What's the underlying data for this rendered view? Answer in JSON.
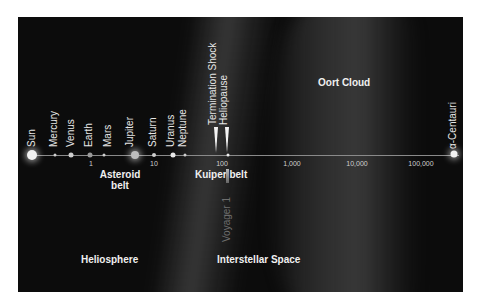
{
  "diagram": {
    "objects": [
      {
        "label": "Sun",
        "x": 14,
        "size": 9
      },
      {
        "label": "Mercury",
        "x": 37,
        "size": 3
      },
      {
        "label": "Venus",
        "x": 53,
        "size": 5
      },
      {
        "label": "Earth",
        "x": 72,
        "size": 5
      },
      {
        "label": "Mars",
        "x": 86,
        "size": 3
      },
      {
        "label": "Jupiter",
        "x": 117,
        "size": 8
      },
      {
        "label": "Saturn",
        "x": 136,
        "size": 4
      },
      {
        "label": "Uranus",
        "x": 155,
        "size": 5
      },
      {
        "label": "Neptune",
        "x": 167,
        "size": 3
      }
    ],
    "ticks": [
      {
        "label": "1",
        "x": 73
      },
      {
        "label": "10",
        "x": 136
      },
      {
        "label": "100",
        "x": 204
      },
      {
        "label": "1,000",
        "x": 274
      },
      {
        "label": "10,000",
        "x": 339
      },
      {
        "label": "100,000",
        "x": 403
      }
    ],
    "boundaries": {
      "termination_shock": "Termination Shock",
      "heliopause": "Heliopause"
    },
    "star": {
      "label": "α-Centauri"
    },
    "regions": {
      "asteroid_belt_line1": "Asteroid",
      "asteroid_belt_line2": "belt",
      "kuiper_belt": "Kuiper belt",
      "oort_cloud": "Oort Cloud",
      "heliosphere": "Heliosphere",
      "interstellar_space": "Interstellar Space"
    },
    "spacecraft": {
      "label": "Voyager 1"
    },
    "colors": {
      "background": "#0c0c0c",
      "text": "#f0f0f0",
      "axis": "#8a8a8a"
    }
  }
}
